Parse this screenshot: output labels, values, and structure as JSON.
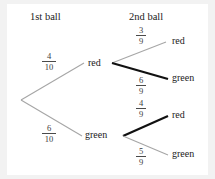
{
  "diagram": {
    "title_columns": [
      {
        "label": "1st ball"
      },
      {
        "label": "2nd ball"
      }
    ],
    "type": "probability-tree",
    "colors": {
      "background": "#ffffff",
      "page": "#f2f2f2",
      "light_branch": "#a6a6a6",
      "bold_branch": "#111111",
      "text": "#1a1a1a",
      "fraction_text": "#3d3d3d"
    },
    "nodes": {
      "first_level": [
        {
          "label": "red"
        },
        {
          "label": "green"
        }
      ],
      "second_level": [
        {
          "label": "red"
        },
        {
          "label": "green"
        },
        {
          "label": "red"
        },
        {
          "label": "green"
        }
      ]
    },
    "branches": [
      {
        "from": "root",
        "to": "red",
        "numerator": "4",
        "denominator": "10",
        "weight": "light"
      },
      {
        "from": "root",
        "to": "green",
        "numerator": "6",
        "denominator": "10",
        "weight": "light"
      },
      {
        "from": "red",
        "to": "red",
        "numerator": "3",
        "denominator": "9",
        "weight": "light"
      },
      {
        "from": "red",
        "to": "green",
        "numerator": "6",
        "denominator": "9",
        "weight": "bold"
      },
      {
        "from": "green",
        "to": "red",
        "numerator": "4",
        "denominator": "9",
        "weight": "bold"
      },
      {
        "from": "green",
        "to": "green",
        "numerator": "5",
        "denominator": "9",
        "weight": "light"
      }
    ]
  }
}
